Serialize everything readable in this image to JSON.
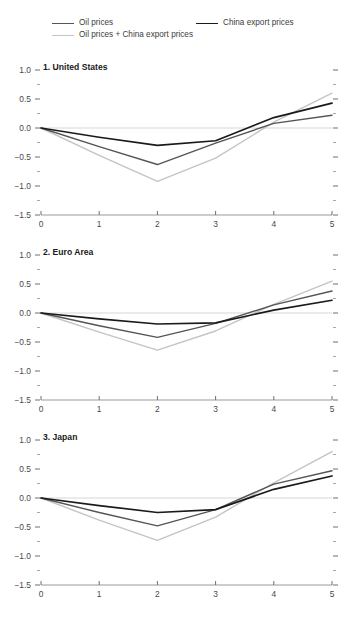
{
  "legend": {
    "items": [
      {
        "label": "Oil prices",
        "color": "#555555",
        "order": 0
      },
      {
        "label": "China export prices",
        "color": "#1a1a1a",
        "order": 1
      },
      {
        "label": "Oil prices + China export prices",
        "color": "#c4c4c4",
        "order": 2
      }
    ]
  },
  "axes": {
    "y_ticks": [
      "1.0",
      "0.5",
      "0.0",
      "-0.5",
      "-1.0",
      "-1.5"
    ],
    "y_tick_values": [
      1.0,
      0.5,
      0.0,
      -0.5,
      -1.0,
      -1.5
    ],
    "y_minor_values": [
      0.75,
      0.25,
      -0.25,
      -0.75,
      -1.25
    ],
    "x_ticks": [
      "0",
      "1",
      "2",
      "3",
      "4",
      "5"
    ],
    "x_tick_values": [
      0,
      1,
      2,
      3,
      4,
      5
    ]
  },
  "chart_data": {
    "type": "line",
    "title": "",
    "xlabel": "",
    "ylabel": "",
    "xlim": [
      0,
      5
    ],
    "ylim": [
      -1.5,
      1.0
    ],
    "grid": false,
    "legend_position": "top",
    "zero_line": true,
    "panels": [
      {
        "index": 1,
        "title": "1. United States",
        "x": [
          0,
          1,
          2,
          3,
          4,
          5
        ],
        "series": [
          {
            "name": "Oil prices",
            "color": "#555555",
            "values": [
              0.0,
              -0.32,
              -0.63,
              -0.26,
              0.08,
              0.22
            ]
          },
          {
            "name": "China export prices",
            "color": "#1a1a1a",
            "values": [
              0.0,
              -0.16,
              -0.3,
              -0.22,
              0.18,
              0.43
            ]
          },
          {
            "name": "Oil prices + China export prices",
            "color": "#c4c4c4",
            "values": [
              0.0,
              -0.47,
              -0.92,
              -0.52,
              0.1,
              0.6
            ]
          }
        ]
      },
      {
        "index": 2,
        "title": "2. Euro Area",
        "x": [
          0,
          1,
          2,
          3,
          4,
          5
        ],
        "series": [
          {
            "name": "Oil prices",
            "color": "#555555",
            "values": [
              0.0,
              -0.22,
              -0.42,
              -0.18,
              0.14,
              0.38
            ]
          },
          {
            "name": "China export prices",
            "color": "#1a1a1a",
            "values": [
              0.0,
              -0.1,
              -0.19,
              -0.17,
              0.05,
              0.22
            ]
          },
          {
            "name": "Oil prices + China export prices",
            "color": "#c4c4c4",
            "values": [
              0.0,
              -0.33,
              -0.64,
              -0.31,
              0.15,
              0.55
            ]
          }
        ]
      },
      {
        "index": 3,
        "title": "3. Japan",
        "x": [
          0,
          1,
          2,
          3,
          4,
          5
        ],
        "series": [
          {
            "name": "Oil prices",
            "color": "#555555",
            "values": [
              0.0,
              -0.25,
              -0.48,
              -0.2,
              0.24,
              0.47
            ]
          },
          {
            "name": "China export prices",
            "color": "#1a1a1a",
            "values": [
              0.0,
              -0.13,
              -0.25,
              -0.2,
              0.15,
              0.38
            ]
          },
          {
            "name": "Oil prices + China export prices",
            "color": "#c4c4c4",
            "values": [
              0.0,
              -0.38,
              -0.73,
              -0.33,
              0.26,
              0.8
            ]
          }
        ]
      }
    ]
  }
}
